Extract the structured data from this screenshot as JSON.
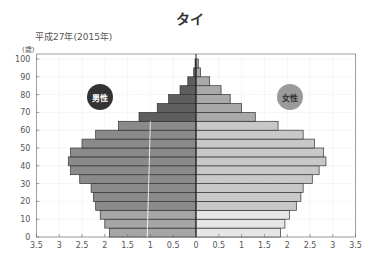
{
  "title": "タイ",
  "subtitle": "平成27年(2015年)",
  "y_unit": "(歳)",
  "legend": {
    "male": "男性",
    "female": "女性"
  },
  "colors": {
    "male_young": "#a6a6a6",
    "male_work": "#8a8a8a",
    "male_old": "#5e5e5e",
    "female_young": "#e6e6e6",
    "female_work": "#c8c8c8",
    "female_old": "#a9a9a9",
    "male_legend": "#333333",
    "female_legend": "#9a9a9a"
  },
  "chart_data": {
    "type": "bar",
    "subtype": "population_pyramid",
    "title": "タイ",
    "subtitle": "平成27年(2015年)",
    "xlabel": "",
    "ylabel": "(歳)",
    "x_ticks": [
      "3.5",
      "3",
      "2.5",
      "2",
      "1.5",
      "1",
      "0.5",
      "0",
      "0.5",
      "1",
      "1.5",
      "2",
      "2.5",
      "3",
      "3.5"
    ],
    "y_ticks": [
      0,
      10,
      20,
      30,
      40,
      50,
      60,
      70,
      80,
      90,
      100
    ],
    "xlim": [
      -3.5,
      3.5
    ],
    "ylim": [
      0,
      100
    ],
    "grid": true,
    "legend_position": "inside-top",
    "categories": [
      "0-4",
      "5-9",
      "10-14",
      "15-19",
      "20-24",
      "25-29",
      "30-34",
      "35-39",
      "40-44",
      "45-49",
      "50-54",
      "55-59",
      "60-64",
      "65-69",
      "70-74",
      "75-79",
      "80-84",
      "85-89",
      "90-94",
      "95-99"
    ],
    "series": [
      {
        "name": "男性",
        "values": [
          1.9,
          2.0,
          2.1,
          2.2,
          2.25,
          2.3,
          2.55,
          2.75,
          2.8,
          2.75,
          2.5,
          2.2,
          1.7,
          1.25,
          0.85,
          0.6,
          0.35,
          0.18,
          0.05,
          0.02
        ]
      },
      {
        "name": "女性",
        "values": [
          1.85,
          1.95,
          2.05,
          2.2,
          2.3,
          2.35,
          2.55,
          2.7,
          2.85,
          2.8,
          2.6,
          2.35,
          1.8,
          1.3,
          1.0,
          0.75,
          0.55,
          0.3,
          0.1,
          0.05
        ]
      }
    ]
  }
}
